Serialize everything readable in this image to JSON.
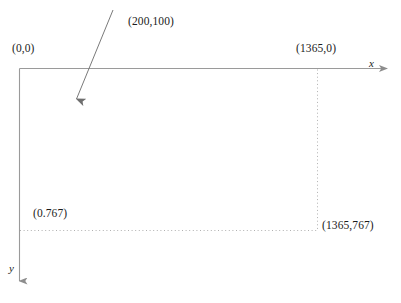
{
  "diagram": {
    "colors": {
      "axis": "#9a9a9a",
      "dotted": "#aaaaaa",
      "pointer": "#7a7a7a",
      "text": "#1b1b1b",
      "background": "#ffffff"
    },
    "axes": [
      {
        "id": "x-axis",
        "name": "x",
        "direction": "right",
        "label": "x"
      },
      {
        "id": "y-axis",
        "name": "y",
        "direction": "down",
        "label": "y"
      }
    ],
    "corner_labels": [
      {
        "id": "origin",
        "text": "(0,0)",
        "x": 0,
        "y": 0
      },
      {
        "id": "top-right",
        "text": "(1365,0)",
        "x": 1365,
        "y": 0
      },
      {
        "id": "bottom-left",
        "text": "(0.767)",
        "x": 0,
        "y": 767
      },
      {
        "id": "bottom-right",
        "text": "(1365,767)",
        "x": 1365,
        "y": 767
      }
    ],
    "annotation": {
      "id": "pointer-annotation",
      "text": "(200,100)",
      "point_x": 200,
      "point_y": 100
    },
    "screen_extent": {
      "width": 1365,
      "height": 767
    },
    "faint_top_text": ""
  }
}
